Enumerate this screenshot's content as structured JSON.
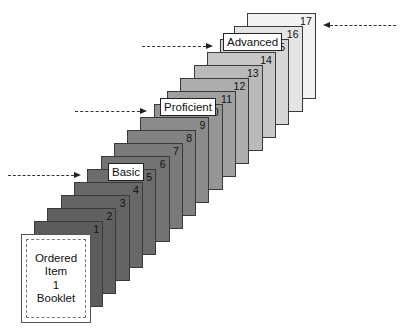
{
  "diagram": {
    "type": "ordered-item-booklet",
    "booklet": {
      "lines": [
        "Ordered",
        "Item",
        "1",
        "Booklet"
      ]
    },
    "pages": [
      {
        "number": "1",
        "color": "#5c5c5c"
      },
      {
        "number": "2",
        "color": "#606060"
      },
      {
        "number": "3",
        "color": "#646464"
      },
      {
        "number": "4",
        "color": "#686868"
      },
      {
        "number": "5",
        "color": "#6d6d6d"
      },
      {
        "number": "6",
        "color": "#737373"
      },
      {
        "number": "7",
        "color": "#7a7a7a"
      },
      {
        "number": "8",
        "color": "#828282"
      },
      {
        "number": "9",
        "color": "#8b8b8b"
      },
      {
        "number": "10",
        "color": "#959595"
      },
      {
        "number": "11",
        "color": "#a0a0a0"
      },
      {
        "number": "12",
        "color": "#adadad"
      },
      {
        "number": "13",
        "color": "#bababa"
      },
      {
        "number": "14",
        "color": "#c8c8c8"
      },
      {
        "number": "15",
        "color": "#d6d6d6"
      },
      {
        "number": "16",
        "color": "#e4e4e4"
      },
      {
        "number": "17",
        "color": "#f2f2f2"
      }
    ],
    "levels": [
      {
        "label": "Basic",
        "page": "5"
      },
      {
        "label": "Proficient",
        "page": "10"
      },
      {
        "label": "Advanced",
        "page": "15"
      }
    ],
    "right_arrow_page": "17"
  }
}
